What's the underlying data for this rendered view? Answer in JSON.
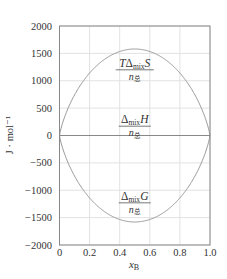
{
  "chart_data": {
    "type": "line",
    "title": "",
    "xlabel": "x_B",
    "ylabel": "J · mol⁻¹",
    "xlim": [
      0,
      1.0
    ],
    "ylim": [
      -2000,
      2000
    ],
    "xticks": [
      "0",
      "0.2",
      "0.4",
      "0.6",
      "0.8",
      "1.0"
    ],
    "yticks": [
      "2000",
      "1500",
      "1000",
      "500",
      "0",
      "-500",
      "-1000",
      "-1500",
      "-2000"
    ],
    "grid": true,
    "legend": null,
    "series": [
      {
        "name": "TΔmixS / n总",
        "x": [
          0,
          0.05,
          0.1,
          0.2,
          0.3,
          0.4,
          0.5,
          0.6,
          0.7,
          0.8,
          0.9,
          0.95,
          1.0
        ],
        "values": [
          0,
          451,
          742,
          1138,
          1389,
          1534,
          1580,
          1534,
          1389,
          1138,
          742,
          451,
          0
        ]
      },
      {
        "name": "ΔmixH / n总",
        "x": [
          0,
          1.0
        ],
        "values": [
          0,
          0
        ]
      },
      {
        "name": "ΔmixG / n总",
        "x": [
          0,
          0.05,
          0.1,
          0.2,
          0.3,
          0.4,
          0.5,
          0.6,
          0.7,
          0.8,
          0.9,
          0.95,
          1.0
        ],
        "values": [
          0,
          -451,
          -742,
          -1138,
          -1389,
          -1534,
          -1580,
          -1534,
          -1389,
          -1138,
          -742,
          -451,
          0
        ]
      }
    ],
    "annotations": [
      {
        "num_prefix": "T",
        "delta": "Δ",
        "sub": "mix",
        "var": "S",
        "den": "n",
        "den_sub": "总",
        "x": 0.5,
        "y": 1200
      },
      {
        "num_prefix": "",
        "delta": "Δ",
        "sub": "mix",
        "var": "H",
        "den": "n",
        "den_sub": "总",
        "x": 0.5,
        "y": 170
      },
      {
        "num_prefix": "",
        "delta": "Δ",
        "sub": "mix",
        "var": "G",
        "den": "n",
        "den_sub": "总",
        "x": 0.5,
        "y": -1230
      }
    ],
    "colors": {
      "curve": "#999999",
      "axis": "#888888",
      "grid": "#e2e2e2",
      "text": "#333333"
    }
  }
}
